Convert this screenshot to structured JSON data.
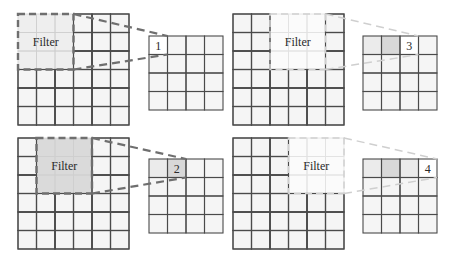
{
  "diagram": {
    "colors": {
      "background": "#ffffff",
      "cell_bg": "#f5f5f5",
      "grid_line": "#4a4a4a",
      "faded_line": "#cfcfcf",
      "filter_fill_active": "#dadada",
      "filter_fill_faded": "#fbfbfb",
      "output_prev": "#ebebeb",
      "output_active": "#d8d8d8",
      "dash_active": "#6f6f6f",
      "dash_faded": "#cfcfcf"
    },
    "panels": [
      {
        "id": "step-1",
        "input": {
          "x": 18,
          "y": 14,
          "size": 6,
          "cell": 18.5
        },
        "filter": {
          "col": 0,
          "row": 0,
          "size": 3,
          "label": "Filter",
          "style": "active-light"
        },
        "output": {
          "x": 149,
          "y": 36,
          "size": 4,
          "cell": 18.5,
          "active_col": 0,
          "label": "1",
          "shaded": []
        }
      },
      {
        "id": "step-3",
        "input": {
          "x": 233,
          "y": 14,
          "size": 6,
          "cell": 18.5
        },
        "filter": {
          "col": 2,
          "row": 0,
          "size": 3,
          "label": "Filter",
          "style": "faded"
        },
        "output": {
          "x": 363,
          "y": 36,
          "size": 4,
          "cell": 18.5,
          "active_col": 2,
          "label": "3",
          "shaded": [
            0,
            1
          ]
        }
      },
      {
        "id": "step-2",
        "input": {
          "x": 18,
          "y": 138,
          "size": 6,
          "cell": 18.5
        },
        "filter": {
          "col": 1,
          "row": 0,
          "size": 3,
          "label": "Filter",
          "style": "active"
        },
        "output": {
          "x": 149,
          "y": 159,
          "size": 4,
          "cell": 18.5,
          "active_col": 1,
          "label": "2",
          "shaded": [
            0
          ]
        }
      },
      {
        "id": "step-4",
        "input": {
          "x": 233,
          "y": 138,
          "size": 6,
          "cell": 18.5
        },
        "filter": {
          "col": 3,
          "row": 0,
          "size": 3,
          "label": "Filter",
          "style": "faded"
        },
        "output": {
          "x": 363,
          "y": 159,
          "size": 4,
          "cell": 18.5,
          "active_col": 3,
          "label": "4",
          "shaded": [
            0,
            1,
            2
          ]
        }
      }
    ]
  }
}
